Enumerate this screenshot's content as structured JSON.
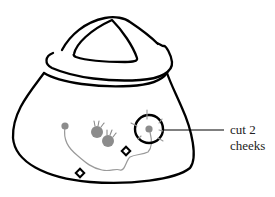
{
  "figure": {
    "annotation": {
      "line1": "cut 2",
      "line2": "cheeks"
    },
    "colors": {
      "outline": "#000000",
      "spot": "#8c8c8c",
      "vein": "#9a9a9a",
      "background": "#ffffff"
    },
    "elements": [
      {
        "name": "cap-handle",
        "shape": "rounded triangle"
      },
      {
        "name": "cap-brim",
        "shape": "ellipse"
      },
      {
        "name": "bell-body",
        "shape": "bell"
      },
      {
        "name": "spot-small-left",
        "shape": "dot"
      },
      {
        "name": "spots-cluster",
        "shape": "two spiky dots"
      },
      {
        "name": "cut-circle",
        "shape": "circle with tick marks"
      },
      {
        "name": "markers",
        "shape": "two open diamonds"
      },
      {
        "name": "vein-line",
        "shape": "wavy line"
      }
    ]
  }
}
